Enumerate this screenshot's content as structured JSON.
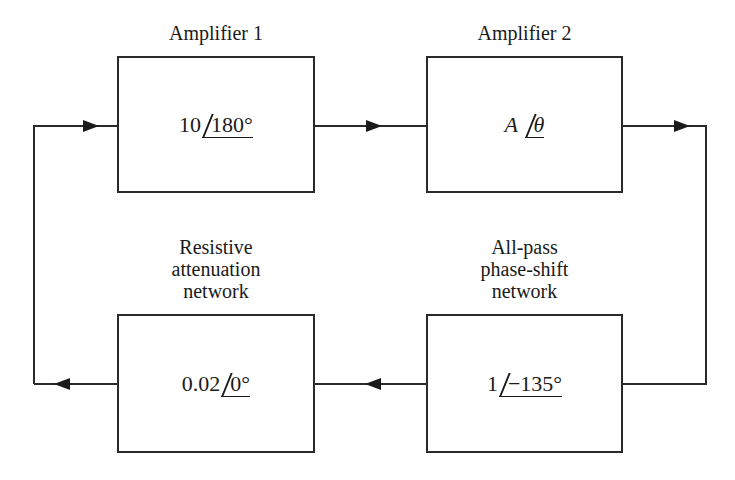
{
  "blocks": {
    "amp1": {
      "title": "Amplifier 1",
      "magnitude": "10",
      "angle": "180°"
    },
    "amp2": {
      "title": "Amplifier 2",
      "magnitude": "A",
      "angle": "θ"
    },
    "attenuator": {
      "title_lines": [
        "Resistive",
        "attenuation",
        "network"
      ],
      "magnitude": "0.02",
      "angle": "0°"
    },
    "phase_shift": {
      "title_lines": [
        "All-pass",
        "phase-shift",
        "network"
      ],
      "magnitude": "1",
      "angle": "−135°"
    }
  },
  "signal_flow": [
    "amp1 -> amp2",
    "amp2 -> phase_shift",
    "phase_shift -> attenuator",
    "attenuator -> amp1"
  ],
  "colors": {
    "line": "#2a2a2a",
    "background": "#ffffff"
  }
}
